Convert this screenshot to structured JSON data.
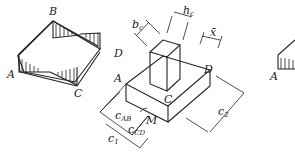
{
  "figure": {
    "left_panel": {
      "labels": {
        "A": "A",
        "B": "B",
        "C": "C",
        "D": "D"
      }
    },
    "center_panel": {
      "labels": {
        "A": "A",
        "C": "C",
        "D": "D",
        "bc": "b",
        "bc_sub": "c",
        "hc": "h",
        "hc_sub": "c",
        "xbar": "x̄",
        "cAB": "c",
        "cAB_sub": "AB",
        "cCD": "c",
        "cCD_sub": "CD",
        "M": "M",
        "c1": "c",
        "c1_sub": "1",
        "c2": "c",
        "c2_sub": "2"
      }
    },
    "right_panel": {
      "labels": {
        "A": "A"
      }
    }
  }
}
